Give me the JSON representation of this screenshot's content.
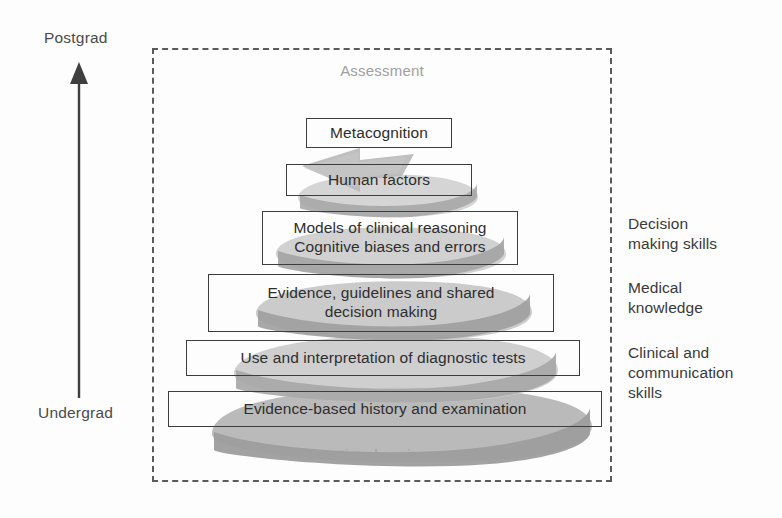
{
  "axis": {
    "top_label": "Postgrad",
    "bottom_label": "Undergrad",
    "arrow_icon": "up-arrow-icon"
  },
  "environment": {
    "top_label": "Assessment",
    "bottom_label": "Educational environment",
    "border_style": "dashed",
    "border_color": "#5b5b5b",
    "label_color": "#a0a0a0"
  },
  "spiral": {
    "icon": "upward-spiral-arrow-icon",
    "color_front": "#9b9b9b",
    "color_back": "#c9c9c9",
    "direction": "upward"
  },
  "layers": [
    {
      "label": "Metacognition"
    },
    {
      "label": "Human factors"
    },
    {
      "label": "Models of clinical reasoning\nCognitive biases and errors"
    },
    {
      "label": "Evidence, guidelines and shared\ndecision making"
    },
    {
      "label": "Use and interpretation of diagnostic tests"
    },
    {
      "label": "Evidence-based history and examination"
    }
  ],
  "side_labels": [
    {
      "label": "Decision\nmaking skills"
    },
    {
      "label": "Medical\nknowledge"
    },
    {
      "label": "Clinical and\ncommunication\nskills"
    }
  ],
  "colors": {
    "box_border": "#3d3d3d",
    "text": "#2e2e2e",
    "axis_text": "#4a4a4a",
    "background": "#fdfdfd"
  }
}
